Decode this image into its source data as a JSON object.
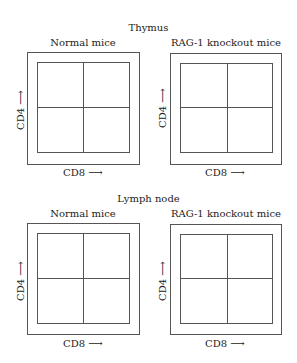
{
  "sections": [
    {
      "title": "Thymus",
      "panels": [
        {
          "title": "Normal mice",
          "xlabel": "CD8 ⟶",
          "ylabel": "CD4 ⟶"
        },
        {
          "title": "RAG-1 knockout mice",
          "xlabel": "CD8 ⟶",
          "ylabel": "CD4 ⟶"
        }
      ]
    },
    {
      "title": "Lymph node",
      "panels": [
        {
          "title": "Normal mice",
          "xlabel": "CD8 ⟶",
          "ylabel": "CD4 ⟶"
        },
        {
          "title": "RAG-1 knockout mice",
          "xlabel": "CD8 ⟶",
          "ylabel": "CD4 ⟶"
        }
      ]
    }
  ]
}
